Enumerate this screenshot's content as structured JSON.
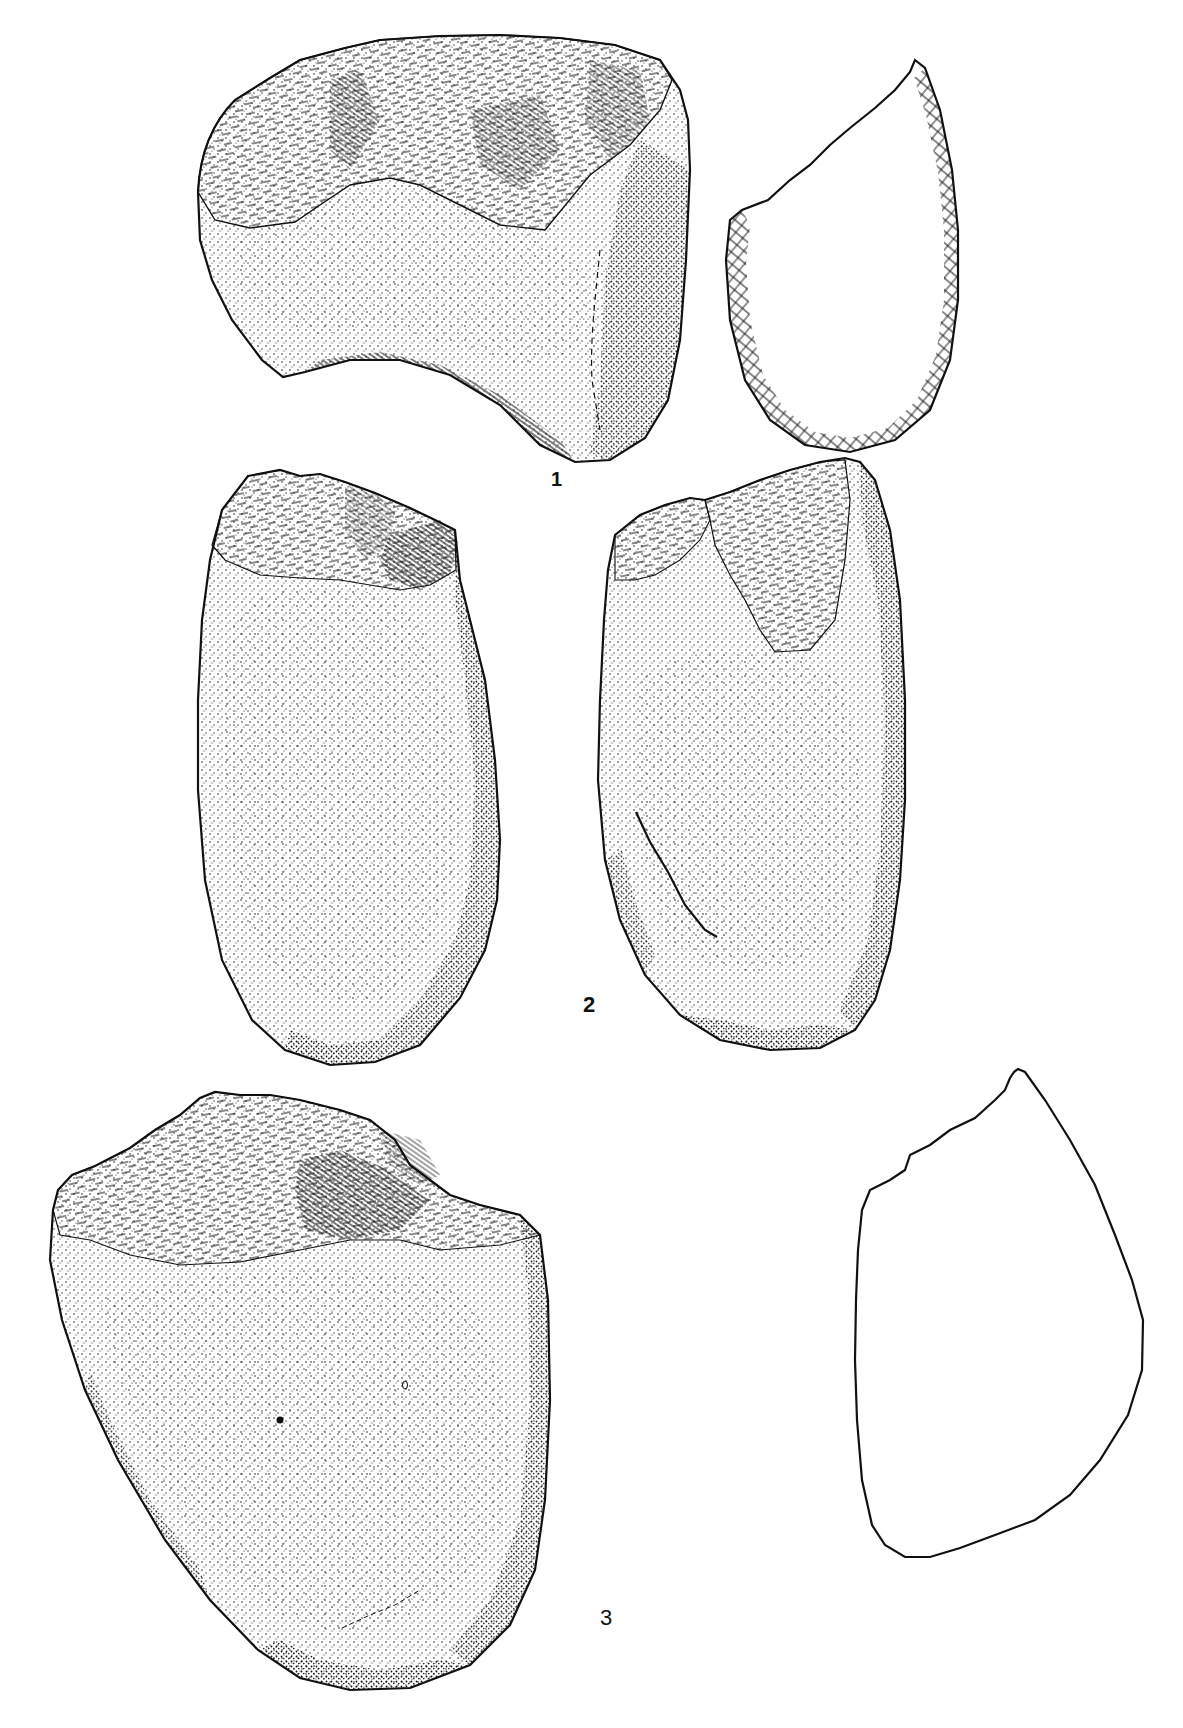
{
  "plate": {
    "type": "archaeological illustration plate",
    "background": "#ffffff",
    "ink": "#111111",
    "figures": [
      {
        "number": "1",
        "label": "1",
        "views": [
          "front-view-drawing",
          "cross-section-outline-hatched"
        ]
      },
      {
        "number": "2",
        "label": "2",
        "views": [
          "face-a-drawing",
          "face-b-drawing"
        ]
      },
      {
        "number": "3",
        "label": "3",
        "views": [
          "front-view-drawing",
          "cross-section-outline"
        ]
      }
    ]
  }
}
